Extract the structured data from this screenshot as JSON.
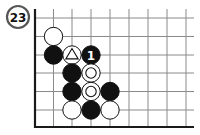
{
  "problem": {
    "number": "23"
  },
  "board": {
    "grid": {
      "origin_x": 35,
      "edge_bottom_y": 127,
      "col_x": [
        35,
        53.5,
        72,
        91,
        110,
        129,
        148,
        167,
        186
      ],
      "row_y": [
        18,
        36.5,
        55,
        73,
        91.5,
        110
      ],
      "line_top_y": 9,
      "line_right_x": 194
    },
    "stones": [
      {
        "color": "white",
        "col": 1,
        "row": 1,
        "marker": ""
      },
      {
        "color": "black",
        "col": 1,
        "row": 2,
        "marker": ""
      },
      {
        "color": "white",
        "col": 2,
        "row": 2,
        "marker": "triangle"
      },
      {
        "color": "black",
        "col": 3,
        "row": 2,
        "marker": "1"
      },
      {
        "color": "black",
        "col": 2,
        "row": 3,
        "marker": ""
      },
      {
        "color": "white",
        "col": 3,
        "row": 3,
        "marker": "circle"
      },
      {
        "color": "black",
        "col": 2,
        "row": 4,
        "marker": ""
      },
      {
        "color": "white",
        "col": 3,
        "row": 4,
        "marker": "circle"
      },
      {
        "color": "black",
        "col": 4,
        "row": 4,
        "marker": ""
      },
      {
        "color": "white",
        "col": 2,
        "row": 5,
        "marker": ""
      },
      {
        "color": "black",
        "col": 3,
        "row": 5,
        "marker": ""
      },
      {
        "color": "white",
        "col": 4,
        "row": 5,
        "marker": ""
      }
    ],
    "colors": {
      "line": "#8a8a8a",
      "edge": "#1a1a1a",
      "black": "#111111",
      "white": "#ffffff"
    }
  }
}
